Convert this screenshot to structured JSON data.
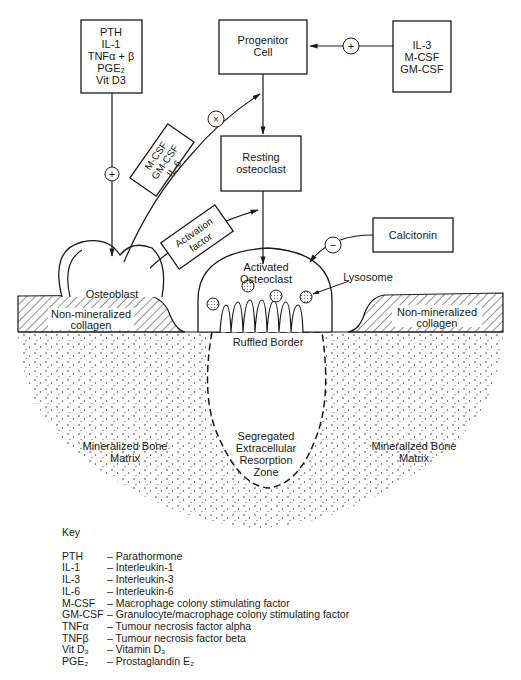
{
  "boxes": {
    "stimulators": [
      "PTH",
      "IL-1",
      "TNFα + β",
      "PGE₂",
      "Vit D3"
    ],
    "progenitor": [
      "Progenitor",
      "Cell"
    ],
    "growth_factors": [
      "IL-3",
      "M-CSF",
      "GM-CSF"
    ],
    "resting": [
      "Resting",
      "osteoclast"
    ],
    "calcitonin": "Calcitonin",
    "csf_tag": [
      "M-CSF",
      "GM-CSF",
      "IL-6"
    ],
    "activation_tag": [
      "Activation",
      "factor"
    ]
  },
  "signs": {
    "plus": "+",
    "minus": "−",
    "times": "×"
  },
  "cells": {
    "osteoblast": "Osteoblast",
    "activated": [
      "Activated",
      "Osteoclast"
    ],
    "lysosome": "Lysosome",
    "ruffled": "Ruffled Border"
  },
  "tissue": {
    "collagen": [
      "Non-mineralized",
      "collagen"
    ],
    "matrix": [
      "Mineralized Bone",
      "Matrix"
    ],
    "zone": [
      "Segregated",
      "Extracellular",
      "Resorption",
      "Zone"
    ]
  },
  "key": {
    "title": "Key",
    "rows": [
      {
        "abbr": "PTH",
        "desc": "– Parathormone"
      },
      {
        "abbr": "IL-1",
        "desc": "– Interleukin-1"
      },
      {
        "abbr": "IL-3",
        "desc": "– Interleukin-3"
      },
      {
        "abbr": "IL-6",
        "desc": "– Interleukin-6"
      },
      {
        "abbr": "M-CSF",
        "desc": "– Macrophage colony stimulating factor"
      },
      {
        "abbr": "GM-CSF",
        "desc": "– Granulocyte/macrophage colony stimulating factor"
      },
      {
        "abbr": "TNFα",
        "desc": "– Tumour necrosis factor alpha"
      },
      {
        "abbr": "TNFβ",
        "desc": "– Tumour necrosis factor beta"
      },
      {
        "abbr": "Vit D₃",
        "desc": "– Vitamin D₃"
      },
      {
        "abbr": "PGE₂",
        "desc": "– Prostaglandin E₂"
      }
    ]
  }
}
